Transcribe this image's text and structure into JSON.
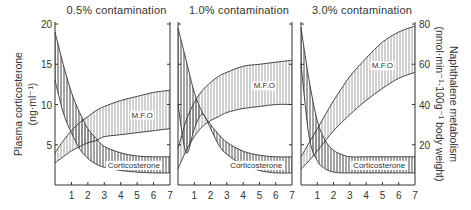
{
  "chart_data": {
    "type": "area",
    "figure_note": "Three side-by-side panels; shaded bands show ranges for plasma corticosterone (left axis) and naphthalene metabolism / M.F.O. activity (right axis) over days of exposure.",
    "left_axis": {
      "label_line1": "Plasma corticosterone",
      "label_line2": "(ng·ml⁻¹)",
      "ticks": [
        5,
        10,
        15,
        20
      ],
      "range": [
        0,
        20
      ]
    },
    "right_axis": {
      "label_line1": "Naphthalene metabolism",
      "label_line2": "(nmol·min⁻¹·100g⁻¹ body weight)",
      "ticks": [
        20,
        40,
        60,
        80
      ],
      "range": [
        0,
        80
      ]
    },
    "x_axis": {
      "ticks": [
        1,
        2,
        3,
        4,
        5,
        6,
        7
      ],
      "range": [
        0,
        7
      ]
    },
    "panels": [
      {
        "title": "0.5% contamination",
        "series": [
          {
            "name": "Corticosterone",
            "axis": "left",
            "x": [
              0,
              0.5,
              1,
              1.5,
              2,
              2.5,
              3,
              4,
              5,
              6,
              7
            ],
            "upper": [
              19.0,
              15.0,
              11.5,
              9.0,
              7.0,
              5.8,
              4.8,
              4.0,
              3.6,
              3.5,
              3.5
            ],
            "lower": [
              13.0,
              9.0,
              6.5,
              4.5,
              3.3,
              2.6,
              2.2,
              1.8,
              1.6,
              1.5,
              1.5
            ]
          },
          {
            "name": "M.F.O",
            "axis": "right",
            "x": [
              0,
              0.5,
              1,
              1.5,
              2,
              2.5,
              3,
              4,
              5,
              6,
              7
            ],
            "upper": [
              16,
              22,
              27,
              31,
              34,
              37,
              39,
              42,
              44,
              46,
              47
            ],
            "lower": [
              11,
              14,
              17,
              19,
              21,
              22,
              24,
              25,
              26,
              27,
              28
            ]
          }
        ]
      },
      {
        "title": "1.0% contamination",
        "series": [
          {
            "name": "Corticosterone",
            "axis": "left",
            "x": [
              0,
              0.5,
              1,
              1.5,
              2,
              2.5,
              3,
              4,
              5,
              6,
              7
            ],
            "upper": [
              19.5,
              15.5,
              11.5,
              9.0,
              7.5,
              6.3,
              5.3,
              4.2,
              3.7,
              3.5,
              3.5
            ],
            "lower": [
              10.0,
              4.0,
              7.0,
              8.8,
              7.0,
              5.0,
              3.8,
              2.5,
              1.8,
              1.5,
              1.5
            ]
          },
          {
            "name": "M.F.O",
            "axis": "right",
            "x": [
              0,
              0.5,
              1,
              1.5,
              2,
              2.5,
              3,
              4,
              5,
              6,
              7
            ],
            "upper": [
              18,
              32,
              41,
              47,
              51,
              54,
              56,
              59,
              60,
              61,
              62
            ],
            "lower": [
              8,
              17,
              24,
              29,
              32,
              34,
              36,
              38,
              39,
              40,
              40
            ]
          }
        ]
      },
      {
        "title": "3.0% contamination",
        "series": [
          {
            "name": "Corticosterone",
            "axis": "left",
            "x": [
              0,
              0.5,
              1,
              1.5,
              2,
              2.5,
              3,
              4,
              5,
              6,
              7
            ],
            "upper": [
              19.5,
              13.0,
              8.0,
              5.5,
              4.3,
              3.8,
              3.5,
              3.5,
              3.5,
              3.5,
              3.5
            ],
            "lower": [
              15.0,
              6.0,
              3.0,
              2.0,
              1.6,
              1.5,
              1.5,
              1.5,
              1.5,
              1.5,
              1.5
            ]
          },
          {
            "name": "M.F.O",
            "axis": "right",
            "x": [
              0,
              0.5,
              1,
              1.5,
              2,
              2.5,
              3,
              4,
              5,
              6,
              7
            ],
            "upper": [
              14,
              21,
              28,
              35,
              42,
              48,
              54,
              63,
              71,
              76,
              79
            ],
            "lower": [
              8,
              12,
              17,
              22,
              27,
              31,
              35,
              42,
              48,
              53,
              56
            ]
          }
        ]
      }
    ],
    "annotations": [
      "M.F.O",
      "Corticosterone"
    ],
    "grid": false,
    "legend": "inline band labels"
  }
}
